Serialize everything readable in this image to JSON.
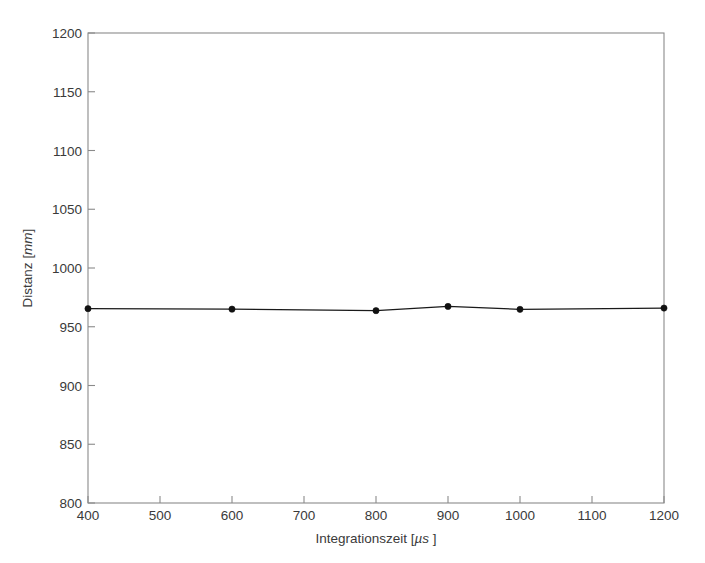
{
  "figure": {
    "background_color": "#ffffff",
    "axis_color": "#8a8a8a",
    "text_color": "#3a3a3a",
    "series_color": "#111111",
    "width": 705,
    "height": 563
  },
  "axes": {
    "x_title_main": "Integrationszeit [",
    "x_title_unit": "µs",
    "x_title_close": "  ]",
    "y_title_main": "Distanz [",
    "y_title_unit": "mm",
    "y_title_close": "]",
    "x_ticks": [
      "400",
      "500",
      "600",
      "700",
      "800",
      "900",
      "1000",
      "1100",
      "1200"
    ],
    "y_ticks": [
      "800",
      "850",
      "900",
      "950",
      "1000",
      "1050",
      "1100",
      "1150",
      "1200"
    ]
  },
  "chart_data": {
    "type": "line",
    "title": "",
    "xlabel": "Integrationszeit [µs  ]",
    "ylabel": "Distanz [mm]",
    "xlim": [
      400,
      1200
    ],
    "ylim": [
      800,
      1200
    ],
    "xticks": [
      400,
      500,
      600,
      700,
      800,
      900,
      1000,
      1100,
      1200
    ],
    "yticks": [
      800,
      850,
      900,
      950,
      1000,
      1050,
      1100,
      1150,
      1200
    ],
    "grid": false,
    "legend": null,
    "marker": "filled-circle",
    "line_style": "solid",
    "series": [
      {
        "name": "Distanz",
        "x": [
          400,
          600,
          800,
          900,
          1000,
          1200
        ],
        "values": [
          965.4,
          965.0,
          963.7,
          967.3,
          964.8,
          965.9
        ]
      }
    ]
  }
}
